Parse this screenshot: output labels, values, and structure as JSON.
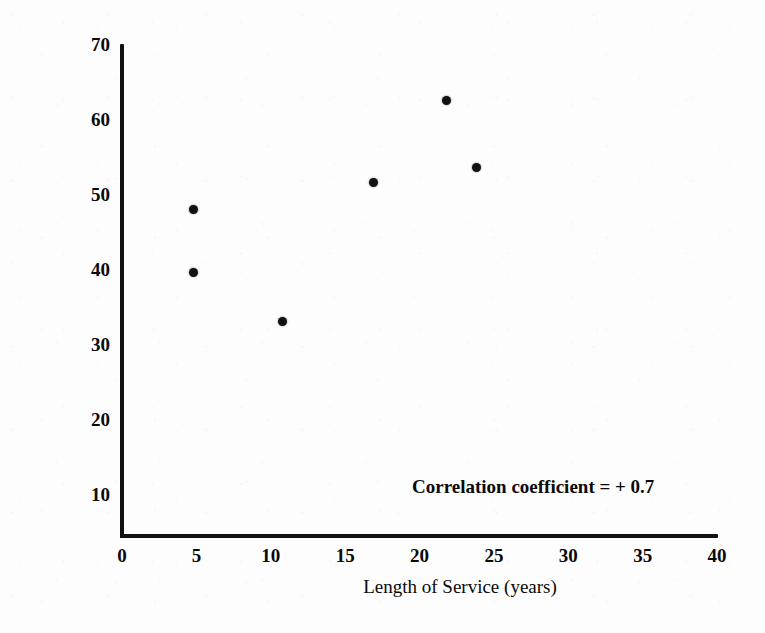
{
  "chart_data": {
    "type": "scatter",
    "title": "",
    "xlabel": "Length of Service (years)",
    "ylabel": "Age (Years)",
    "xlim": [
      0,
      40
    ],
    "ylim": [
      4.5,
      70
    ],
    "grid": false,
    "legend": "none",
    "x_ticks": [
      "0",
      "5",
      "10",
      "15",
      "20",
      "25",
      "30",
      "35",
      "40"
    ],
    "x_tick_values": [
      0,
      5,
      10,
      15,
      20,
      25,
      30,
      35,
      40
    ],
    "y_ticks": [
      "70",
      "60",
      "50",
      "40",
      "30",
      "20",
      "10"
    ],
    "y_tick_values": [
      70,
      60,
      50,
      40,
      30,
      20,
      10
    ],
    "points": [
      {
        "x": 4.8,
        "y": 48.0
      },
      {
        "x": 4.8,
        "y": 39.5
      },
      {
        "x": 10.8,
        "y": 33.0
      },
      {
        "x": 16.9,
        "y": 51.5
      },
      {
        "x": 21.8,
        "y": 62.5
      },
      {
        "x": 23.8,
        "y": 53.5
      }
    ],
    "annotations": [
      {
        "text": "Correlation coefficient = + 0.7",
        "x": 23,
        "y": 10
      }
    ],
    "marker_color": "#111111",
    "axis_color": "#111111",
    "background_color": "#fdfdfd"
  }
}
